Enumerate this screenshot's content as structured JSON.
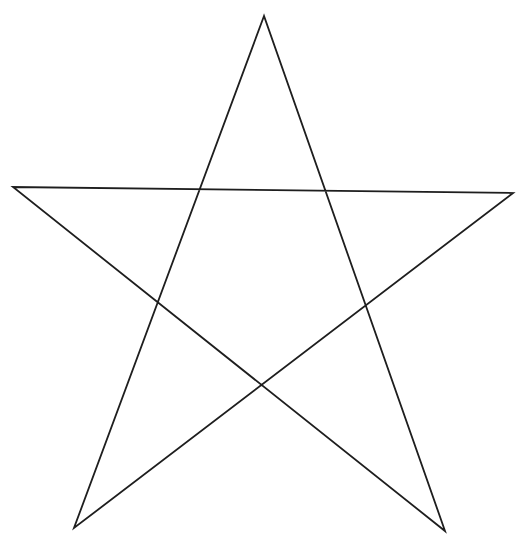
{
  "canvas": {
    "width": 530,
    "height": 549,
    "background": "#ffffff"
  },
  "diagram": {
    "shape": "pentagram",
    "label": "Five-pointed star line drawing",
    "stroke_color": "#1e1e1e",
    "stroke_width": 1.8,
    "vertices": {
      "top": [
        264,
        16
      ],
      "left": [
        13,
        187
      ],
      "right": [
        513,
        193
      ],
      "bottom_left": [
        74,
        528
      ],
      "bottom_right": [
        445,
        531
      ]
    },
    "segments": [
      {
        "name": "top-to-bottom-left",
        "from": "top",
        "to": "bottom_left"
      },
      {
        "name": "bottom-left-to-right",
        "from": "bottom_left",
        "to": "right"
      },
      {
        "name": "right-to-left",
        "from": "right",
        "to": "left"
      },
      {
        "name": "left-to-bottom-right",
        "from": "left",
        "to": "bottom_right"
      },
      {
        "name": "bottom-right-to-top",
        "from": "bottom_right",
        "to": "top"
      }
    ]
  }
}
